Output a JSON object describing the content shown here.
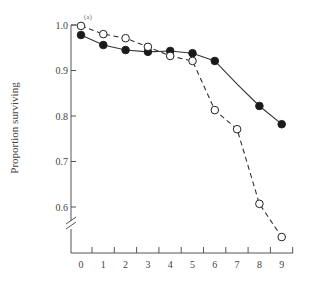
{
  "chart_data": {
    "type": "line",
    "title": "",
    "panel_label": "(a)",
    "xlabel": "",
    "ylabel": "Proportion surviving",
    "x": [
      0,
      1,
      2,
      3,
      4,
      5,
      6,
      7,
      8,
      9
    ],
    "x_tick_labels": [
      "0",
      "1",
      "2",
      "3",
      "4",
      "5",
      "6",
      "7",
      "8",
      "9"
    ],
    "y_tick_labels": [
      "1.0",
      "0.9",
      "0.8",
      "0.7",
      "0.6"
    ],
    "y_ticks": [
      1.0,
      0.9,
      0.8,
      0.7,
      0.6
    ],
    "ylim": [
      0.5,
      1.0
    ],
    "axis_break": true,
    "grid": false,
    "legend": "none",
    "series": [
      {
        "name": "filled circles (solid line)",
        "marker": "filled-circle",
        "line": "solid",
        "values": [
          0.978,
          0.956,
          0.945,
          0.941,
          0.943,
          0.938,
          0.921,
          0.87,
          0.822,
          0.782
        ],
        "markers_at": [
          0,
          1,
          2,
          3,
          4,
          5,
          6,
          8,
          9
        ]
      },
      {
        "name": "open circles (dashed line)",
        "marker": "open-circle",
        "line": "dashed",
        "values": [
          0.998,
          0.98,
          0.971,
          0.952,
          0.932,
          0.921,
          0.813,
          0.771,
          0.607,
          0.534
        ],
        "markers_at": [
          0,
          1,
          2,
          3,
          4,
          5,
          6,
          7,
          8,
          9
        ]
      }
    ]
  }
}
